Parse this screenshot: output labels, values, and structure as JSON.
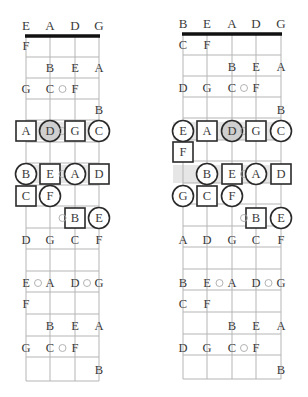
{
  "diagram": {
    "boards": [
      {
        "id": "four-string",
        "tuning": [
          "E",
          "A",
          "D",
          "G"
        ],
        "string_x": [
          26,
          50,
          75,
          99
        ],
        "nut_y": 36,
        "bottom_y": 381,
        "fret_lines_y": [
          57,
          78,
          99,
          120,
          142,
          163,
          185,
          206,
          228,
          249,
          271,
          292,
          314,
          336,
          357
        ],
        "notes": [
          {
            "label": "F",
            "string": 0,
            "y": 46
          },
          {
            "label": "B",
            "string": 1,
            "y": 68
          },
          {
            "label": "E",
            "string": 2,
            "y": 68
          },
          {
            "label": "A",
            "string": 3,
            "y": 68
          },
          {
            "label": "G",
            "string": 0,
            "y": 89
          },
          {
            "label": "C",
            "string": 1,
            "y": 89,
            "dot_after": true
          },
          {
            "label": "F",
            "string": 2,
            "y": 89
          },
          {
            "label": "B",
            "string": 3,
            "y": 110
          },
          {
            "label": "A",
            "string": 0,
            "y": 131,
            "shape": "square"
          },
          {
            "label": "D",
            "string": 1,
            "y": 131,
            "shape": "circle",
            "filled": true,
            "dot_after": true
          },
          {
            "label": "G",
            "string": 2,
            "y": 131,
            "shape": "square"
          },
          {
            "label": "C",
            "string": 3,
            "y": 131,
            "shape": "circle"
          },
          {
            "label": "B",
            "string": 0,
            "y": 174,
            "shape": "circle"
          },
          {
            "label": "E",
            "string": 1,
            "y": 174,
            "shape": "square",
            "dot_after": true
          },
          {
            "label": "A",
            "string": 2,
            "y": 174,
            "shape": "circle"
          },
          {
            "label": "D",
            "string": 3,
            "y": 174,
            "shape": "square"
          },
          {
            "label": "C",
            "string": 0,
            "y": 196,
            "shape": "square"
          },
          {
            "label": "F",
            "string": 1,
            "y": 196,
            "shape": "circle"
          },
          {
            "label": "B",
            "string": 2,
            "y": 218,
            "shape": "square",
            "dot_before": true
          },
          {
            "label": "E",
            "string": 3,
            "y": 218,
            "shape": "circle"
          },
          {
            "label": "D",
            "string": 0,
            "y": 240
          },
          {
            "label": "G",
            "string": 1,
            "y": 240
          },
          {
            "label": "C",
            "string": 2,
            "y": 240
          },
          {
            "label": "F",
            "string": 3,
            "y": 240
          },
          {
            "label": "E",
            "string": 0,
            "y": 283,
            "dot_after": true
          },
          {
            "label": "A",
            "string": 1,
            "y": 283
          },
          {
            "label": "D",
            "string": 2,
            "y": 283,
            "dot_after": true
          },
          {
            "label": "G",
            "string": 3,
            "y": 283
          },
          {
            "label": "F",
            "string": 0,
            "y": 304
          },
          {
            "label": "B",
            "string": 1,
            "y": 326
          },
          {
            "label": "E",
            "string": 2,
            "y": 326
          },
          {
            "label": "A",
            "string": 3,
            "y": 326
          },
          {
            "label": "G",
            "string": 0,
            "y": 348
          },
          {
            "label": "C",
            "string": 1,
            "y": 348,
            "dot_after": true
          },
          {
            "label": "F",
            "string": 2,
            "y": 348
          },
          {
            "label": "B",
            "string": 3,
            "y": 370
          }
        ],
        "bands": [
          {
            "y": 122,
            "h": 18,
            "x1": 18,
            "x2": 108
          },
          {
            "y": 165,
            "h": 18,
            "x1": 18,
            "x2": 108
          }
        ]
      },
      {
        "id": "five-string",
        "tuning": [
          "B",
          "E",
          "A",
          "D",
          "G"
        ],
        "string_x": [
          183,
          207,
          232,
          256,
          281
        ],
        "nut_y": 34,
        "bottom_y": 379,
        "fret_lines_y": [
          55,
          76,
          97,
          118,
          140,
          161,
          183,
          204,
          226,
          247,
          269,
          290,
          312,
          334,
          355
        ],
        "notes": [
          {
            "label": "C",
            "string": 0,
            "y": 45
          },
          {
            "label": "F",
            "string": 1,
            "y": 45
          },
          {
            "label": "B",
            "string": 2,
            "y": 67
          },
          {
            "label": "E",
            "string": 3,
            "y": 67
          },
          {
            "label": "A",
            "string": 4,
            "y": 67
          },
          {
            "label": "D",
            "string": 0,
            "y": 88
          },
          {
            "label": "G",
            "string": 1,
            "y": 88
          },
          {
            "label": "C",
            "string": 2,
            "y": 88,
            "dot_after": true
          },
          {
            "label": "F",
            "string": 3,
            "y": 88
          },
          {
            "label": "B",
            "string": 4,
            "y": 110
          },
          {
            "label": "E",
            "string": 0,
            "y": 131,
            "shape": "circle"
          },
          {
            "label": "A",
            "string": 1,
            "y": 131,
            "shape": "square"
          },
          {
            "label": "D",
            "string": 2,
            "y": 131,
            "shape": "circle",
            "filled": true,
            "dot_after": true
          },
          {
            "label": "G",
            "string": 3,
            "y": 131,
            "shape": "square"
          },
          {
            "label": "C",
            "string": 4,
            "y": 131,
            "shape": "circle"
          },
          {
            "label": "F",
            "string": 0,
            "y": 152,
            "shape": "square"
          },
          {
            "label": "B",
            "string": 1,
            "y": 174,
            "shape": "circle"
          },
          {
            "label": "E",
            "string": 2,
            "y": 174,
            "shape": "square",
            "dot_after": true
          },
          {
            "label": "A",
            "string": 3,
            "y": 174,
            "shape": "circle"
          },
          {
            "label": "D",
            "string": 4,
            "y": 174,
            "shape": "square"
          },
          {
            "label": "G",
            "string": 0,
            "y": 196,
            "shape": "circle"
          },
          {
            "label": "C",
            "string": 1,
            "y": 196,
            "shape": "square"
          },
          {
            "label": "F",
            "string": 2,
            "y": 196,
            "shape": "circle"
          },
          {
            "label": "B",
            "string": 3,
            "y": 218,
            "shape": "square",
            "dot_before": true
          },
          {
            "label": "E",
            "string": 4,
            "y": 218,
            "shape": "circle"
          },
          {
            "label": "A",
            "string": 0,
            "y": 240
          },
          {
            "label": "D",
            "string": 1,
            "y": 240
          },
          {
            "label": "G",
            "string": 2,
            "y": 240
          },
          {
            "label": "C",
            "string": 3,
            "y": 240
          },
          {
            "label": "F",
            "string": 4,
            "y": 240
          },
          {
            "label": "B",
            "string": 0,
            "y": 283
          },
          {
            "label": "E",
            "string": 1,
            "y": 283,
            "dot_after": true
          },
          {
            "label": "A",
            "string": 2,
            "y": 283
          },
          {
            "label": "D",
            "string": 3,
            "y": 283,
            "dot_after": true
          },
          {
            "label": "G",
            "string": 4,
            "y": 283
          },
          {
            "label": "C",
            "string": 0,
            "y": 304
          },
          {
            "label": "F",
            "string": 1,
            "y": 304
          },
          {
            "label": "B",
            "string": 2,
            "y": 326
          },
          {
            "label": "E",
            "string": 3,
            "y": 326
          },
          {
            "label": "A",
            "string": 4,
            "y": 326
          },
          {
            "label": "D",
            "string": 0,
            "y": 348
          },
          {
            "label": "G",
            "string": 1,
            "y": 348
          },
          {
            "label": "C",
            "string": 2,
            "y": 348,
            "dot_after": true
          },
          {
            "label": "F",
            "string": 3,
            "y": 348
          },
          {
            "label": "B",
            "string": 4,
            "y": 370
          }
        ],
        "bands": [
          {
            "y": 122,
            "h": 18,
            "x1": 173,
            "x2": 291
          },
          {
            "y": 165,
            "h": 18,
            "x1": 173,
            "x2": 291
          }
        ]
      }
    ]
  },
  "colors": {
    "grid": "#b5b5b5",
    "nut": "#111111",
    "text": "#3a3a3a",
    "marker_stroke": "#2a2a2a",
    "filled_marker": "#cfcfcf"
  }
}
